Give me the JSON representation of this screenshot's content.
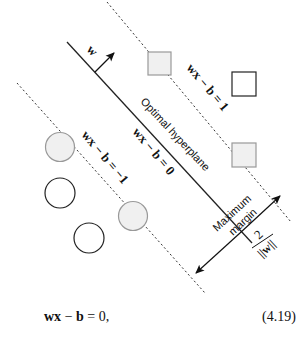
{
  "diagram": {
    "labels": {
      "normal_vector": "w",
      "upper_margin": "wx − b = 1",
      "optimal": "wx − b = 0",
      "lower_margin": "wx − b = −1",
      "hyperplane": "Optimal hyperplane",
      "maximum": "Maximum",
      "margin": "margin",
      "frac_num": "2",
      "frac_den": "||w||"
    },
    "points": {
      "squares": [
        {
          "x": 148,
          "y": 52,
          "fill": "#f0f0f0",
          "support_vector": true
        },
        {
          "x": 232,
          "y": 72,
          "fill": "#ffffff",
          "support_vector": false
        },
        {
          "x": 232,
          "y": 143,
          "fill": "#f0f0f0",
          "support_vector": true
        }
      ],
      "circles": [
        {
          "cx": 60,
          "cy": 147,
          "fill": "#f0f0f0",
          "support_vector": true
        },
        {
          "cx": 60,
          "cy": 193,
          "fill": "#ffffff",
          "support_vector": false
        },
        {
          "cx": 89,
          "cy": 238,
          "fill": "#ffffff",
          "support_vector": false
        },
        {
          "cx": 133,
          "cy": 216,
          "fill": "#f0f0f0",
          "support_vector": true
        }
      ]
    }
  },
  "equation": {
    "text_w": "wx",
    "text_minus": " − ",
    "text_b": "b",
    "text_rest": " = 0,",
    "number": "(4.19)"
  }
}
